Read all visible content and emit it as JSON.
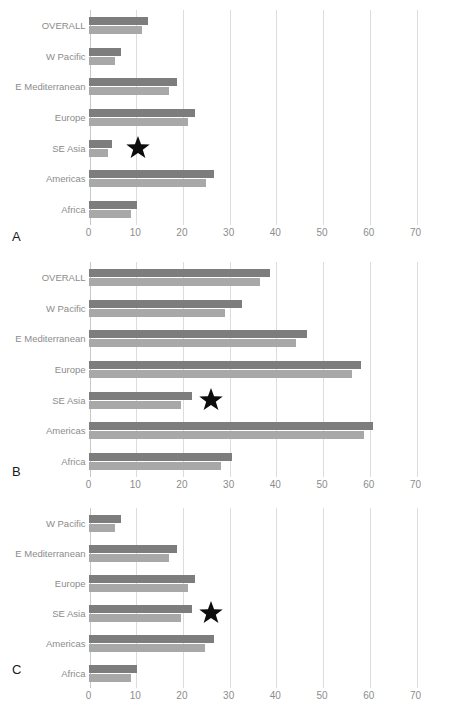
{
  "figure": {
    "width": 450,
    "height": 703,
    "background": "#ffffff",
    "bar_color_dark": "#7d7d7d",
    "bar_color_light": "#a8a8a8",
    "gridline_color": "#dcdcdc",
    "label_color": "#8c8c8c",
    "star_color": "#0d0d0d",
    "star_marker_name": "star-marker"
  },
  "panels": [
    {
      "letter": "A",
      "categories": [
        "OVERALL",
        "W Pacific",
        "E Mediterranean",
        "Europe",
        "SE Asia",
        "Americas",
        "Africa"
      ],
      "series": [
        {
          "name": "series-dark",
          "values": [
            12.8,
            7.0,
            19.0,
            22.8,
            5.1,
            26.8,
            10.4
          ]
        },
        {
          "name": "series-light",
          "values": [
            11.5,
            5.6,
            17.3,
            21.2,
            4.2,
            25.2,
            9.0
          ]
        }
      ],
      "star": {
        "category": "SE Asia",
        "x": 10.5
      },
      "xticks": [
        0,
        10,
        20,
        30,
        40,
        50,
        60,
        70
      ],
      "xlim": [
        0,
        70
      ]
    },
    {
      "letter": "B",
      "categories": [
        "OVERALL",
        "W Pacific",
        "E Mediterranean",
        "Europe",
        "SE Asia",
        "Americas",
        "Africa"
      ],
      "series": [
        {
          "name": "series-dark",
          "values": [
            38.9,
            32.8,
            46.7,
            58.3,
            22.1,
            61.0,
            30.7
          ]
        },
        {
          "name": "series-light",
          "values": [
            36.8,
            29.2,
            44.5,
            56.4,
            19.7,
            58.9,
            28.3
          ]
        }
      ],
      "star": {
        "category": "SE Asia",
        "x": 26.2
      },
      "xticks": [
        0,
        10,
        20,
        30,
        40,
        50,
        60,
        70
      ],
      "xlim": [
        0,
        70
      ]
    },
    {
      "letter": "C",
      "categories": [
        "W Pacific",
        "E Mediterranean",
        "Europe",
        "SE Asia",
        "Americas",
        "Africa"
      ],
      "series": [
        {
          "name": "series-dark",
          "values": [
            7.0,
            19.0,
            22.8,
            22.1,
            26.8,
            10.4
          ]
        },
        {
          "name": "series-light",
          "values": [
            5.6,
            17.3,
            21.2,
            19.7,
            25.0,
            9.0
          ]
        }
      ],
      "star": {
        "category": "SE Asia",
        "x": 26.2
      },
      "xticks": [
        0,
        10,
        20,
        30,
        40,
        50,
        60,
        70
      ],
      "xlim": [
        0,
        70
      ]
    }
  ],
  "chart_data": {
    "type": "bar",
    "title": "",
    "xlabel": "",
    "ylabel": "",
    "orientation": "horizontal",
    "grid": true,
    "legend": "none",
    "xlim": [
      0,
      70
    ],
    "xticks": [
      0,
      10,
      20,
      30,
      40,
      50,
      60,
      70
    ],
    "panels": [
      {
        "panel": "A",
        "categories": [
          "OVERALL",
          "W Pacific",
          "E Mediterranean",
          "Europe",
          "SE Asia",
          "Americas",
          "Africa"
        ],
        "series": [
          {
            "name": "upper-dark-bar",
            "values": [
              12.8,
              7.0,
              19.0,
              22.8,
              5.1,
              26.8,
              10.4
            ]
          },
          {
            "name": "lower-light-bar",
            "values": [
              11.5,
              5.6,
              17.3,
              21.2,
              4.2,
              25.2,
              9.0
            ]
          }
        ],
        "annotations": [
          {
            "marker": "star",
            "category": "SE Asia",
            "x": 10.5
          }
        ]
      },
      {
        "panel": "B",
        "categories": [
          "OVERALL",
          "W Pacific",
          "E Mediterranean",
          "Europe",
          "SE Asia",
          "Americas",
          "Africa"
        ],
        "series": [
          {
            "name": "upper-dark-bar",
            "values": [
              38.9,
              32.8,
              46.7,
              58.3,
              22.1,
              61.0,
              30.7
            ]
          },
          {
            "name": "lower-light-bar",
            "values": [
              36.8,
              29.2,
              44.5,
              56.4,
              19.7,
              58.9,
              28.3
            ]
          }
        ],
        "annotations": [
          {
            "marker": "star",
            "category": "SE Asia",
            "x": 26.2
          }
        ]
      },
      {
        "panel": "C",
        "categories": [
          "W Pacific",
          "E Mediterranean",
          "Europe",
          "SE Asia",
          "Americas",
          "Africa"
        ],
        "series": [
          {
            "name": "upper-dark-bar",
            "values": [
              7.0,
              19.0,
              22.8,
              22.1,
              26.8,
              10.4
            ]
          },
          {
            "name": "lower-light-bar",
            "values": [
              5.6,
              17.3,
              21.2,
              19.7,
              25.0,
              9.0
            ]
          }
        ],
        "annotations": [
          {
            "marker": "star",
            "category": "SE Asia",
            "x": 26.2
          }
        ]
      }
    ]
  }
}
